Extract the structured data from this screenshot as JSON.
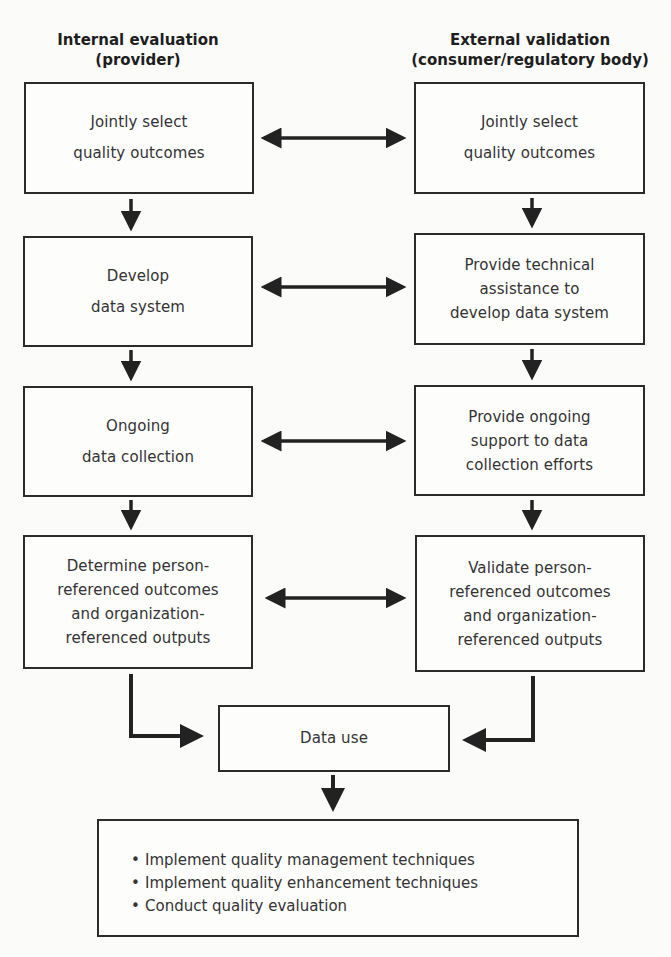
{
  "columns": {
    "left": {
      "title_line1": "Internal evaluation",
      "title_line2": "(provider)"
    },
    "right": {
      "title_line1": "External validation",
      "title_line2": "(consumer/regulatory body)"
    }
  },
  "left_steps": [
    {
      "lines": [
        "Jointly select",
        "quality outcomes"
      ]
    },
    {
      "lines": [
        "Develop",
        "data system"
      ]
    },
    {
      "lines": [
        "Ongoing",
        "data collection"
      ]
    },
    {
      "lines": [
        "Determine person-",
        "referenced outcomes",
        "and organization-",
        "referenced outputs"
      ]
    }
  ],
  "right_steps": [
    {
      "lines": [
        "Jointly select",
        "quality outcomes"
      ]
    },
    {
      "lines": [
        "Provide technical",
        "assistance to",
        "develop data system"
      ]
    },
    {
      "lines": [
        "Provide ongoing",
        "support to data",
        "collection efforts"
      ]
    },
    {
      "lines": [
        "Validate person-",
        "referenced outcomes",
        "and organization-",
        "referenced outputs"
      ]
    }
  ],
  "data_use": {
    "label": "Data use"
  },
  "outcomes": {
    "items": [
      "Implement quality management techniques",
      "Implement quality enhancement techniques",
      "Conduct quality evaluation"
    ]
  },
  "connectors": {
    "bidirectional_arrows": 4,
    "down_arrows": 7,
    "elbow_arrows": 2,
    "color": "#222222"
  }
}
